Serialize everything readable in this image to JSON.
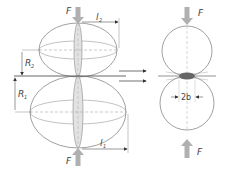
{
  "diagram": {
    "labels": {
      "force_top_left": "F",
      "force_bottom_left": "F",
      "force_top_right": "F",
      "force_bottom_right": "F",
      "radius_1": "R",
      "radius_1_sub": "1",
      "radius_2": "R",
      "radius_2_sub": "2",
      "length_1": "l",
      "length_1_sub": "1",
      "length_2": "l",
      "length_2_sub": "2",
      "contact_width": "2b"
    },
    "colors": {
      "outline": "#777777",
      "arrow_fill": "#b0b0b0",
      "contact_fill": "#666666",
      "lens_fill": "#d8d8d8",
      "text": "#444444"
    }
  }
}
